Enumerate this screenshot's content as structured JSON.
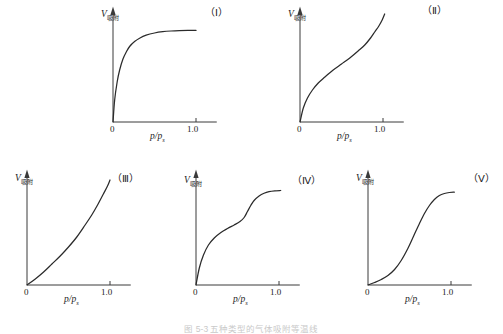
{
  "figure": {
    "caption": "图 5-3  五种类型的气体吸附等温线",
    "axis": {
      "y_label_main": "V",
      "y_label_sub": "吸附",
      "x_label_main": "p/p",
      "x_label_sub": "s",
      "x_tick_zero": "0",
      "x_tick_one": "1.0"
    },
    "stroke_color": "#2b2b2b",
    "axis_color": "#3a3a3a",
    "background": "#ffffff"
  },
  "chart_data": [
    {
      "type": "line",
      "title": "（Ⅰ）",
      "tag": "（Ⅰ）",
      "xlabel": "p/ps",
      "ylabel": "V吸附",
      "xlim": [
        0,
        1.25
      ],
      "ylim": [
        0,
        1.0
      ],
      "grid": false,
      "legend": "none",
      "description": "Type I isotherm — Langmuir, steep uptake at low relative pressure then horizontal plateau (microporous).",
      "x": [
        0.0,
        0.02,
        0.05,
        0.08,
        0.12,
        0.16,
        0.2,
        0.26,
        0.32,
        0.4,
        0.5,
        0.6,
        0.7,
        0.8,
        0.9,
        1.0
      ],
      "y": [
        0.0,
        0.22,
        0.4,
        0.52,
        0.63,
        0.7,
        0.755,
        0.805,
        0.838,
        0.868,
        0.89,
        0.903,
        0.91,
        0.914,
        0.916,
        0.916
      ]
    },
    {
      "type": "line",
      "title": "（Ⅱ）",
      "tag": "（Ⅱ）",
      "xlabel": "p/ps",
      "ylabel": "V吸附",
      "xlim": [
        0,
        1.25
      ],
      "ylim": [
        0,
        1.0
      ],
      "grid": false,
      "legend": "none",
      "description": "Type III isotherm shape as drawn — concave to pressure axis, gentle start, near-linear middle, sharp upturn approaching saturation.",
      "x": [
        0.0,
        0.04,
        0.09,
        0.15,
        0.22,
        0.3,
        0.4,
        0.5,
        0.6,
        0.7,
        0.78,
        0.85,
        0.9,
        0.95,
        0.99,
        1.02
      ],
      "y": [
        0.0,
        0.14,
        0.24,
        0.32,
        0.39,
        0.45,
        0.52,
        0.58,
        0.64,
        0.71,
        0.77,
        0.84,
        0.9,
        0.96,
        1.02,
        1.08
      ]
    },
    {
      "type": "line",
      "title": "（Ⅲ）",
      "tag": "（Ⅲ）",
      "xlabel": "p/ps",
      "ylabel": "V吸附",
      "xlim": [
        0,
        1.25
      ],
      "ylim": [
        0,
        1.0
      ],
      "grid": false,
      "legend": "none",
      "description": "Type III isotherm — convex to the pressure axis throughout, slow start and accelerating uptake near saturation.",
      "x": [
        0.0,
        0.1,
        0.2,
        0.3,
        0.4,
        0.5,
        0.6,
        0.7,
        0.78,
        0.85,
        0.92,
        0.97,
        1.0
      ],
      "y": [
        0.0,
        0.06,
        0.13,
        0.21,
        0.29,
        0.38,
        0.48,
        0.6,
        0.7,
        0.8,
        0.91,
        0.99,
        1.05
      ]
    },
    {
      "type": "line",
      "title": "（Ⅳ）",
      "tag": "（Ⅳ）",
      "xlabel": "p/ps",
      "ylabel": "V吸附",
      "xlim": [
        0,
        1.25
      ],
      "ylim": [
        0,
        1.0
      ],
      "grid": false,
      "legend": "none",
      "description": "Type IV isotherm — initial monolayer knee, intermediate shoulder, capillary-condensation step then final plateau (mesoporous).",
      "x": [
        0.0,
        0.04,
        0.09,
        0.15,
        0.22,
        0.3,
        0.38,
        0.46,
        0.53,
        0.58,
        0.62,
        0.66,
        0.7,
        0.76,
        0.82,
        0.88,
        0.95,
        1.02
      ],
      "y": [
        0.0,
        0.17,
        0.3,
        0.4,
        0.47,
        0.525,
        0.565,
        0.6,
        0.635,
        0.675,
        0.735,
        0.795,
        0.845,
        0.89,
        0.918,
        0.934,
        0.942,
        0.945
      ]
    },
    {
      "type": "line",
      "title": "（Ⅴ）",
      "tag": "（Ⅴ）",
      "xlabel": "p/ps",
      "ylabel": "V吸附",
      "xlim": [
        0,
        1.25
      ],
      "ylim": [
        0,
        1.0
      ],
      "grid": false,
      "legend": "none",
      "description": "Type V isotherm — sigmoid, very low uptake at low relative pressure, steep capillary condensation step, then plateau.",
      "x": [
        0.0,
        0.08,
        0.16,
        0.24,
        0.32,
        0.4,
        0.48,
        0.55,
        0.62,
        0.68,
        0.74,
        0.8,
        0.86,
        0.92,
        0.98,
        1.04
      ],
      "y": [
        0.0,
        0.025,
        0.055,
        0.095,
        0.155,
        0.245,
        0.365,
        0.49,
        0.615,
        0.715,
        0.795,
        0.855,
        0.895,
        0.915,
        0.925,
        0.928
      ]
    }
  ],
  "panels": [
    {
      "tag": "（Ⅰ）",
      "ylabel_main": "V",
      "ylabel_sub": "吸附",
      "xlabel_main": "p/p",
      "xlabel_sub": "s",
      "tick_zero": "0",
      "tick_one": "1.0"
    },
    {
      "tag": "（Ⅱ）",
      "ylabel_main": "V",
      "ylabel_sub": "吸附",
      "xlabel_main": "p/p",
      "xlabel_sub": "s",
      "tick_zero": "0",
      "tick_one": "1.0"
    },
    {
      "tag": "（Ⅲ）",
      "ylabel_main": "V",
      "ylabel_sub": "吸附",
      "xlabel_main": "p/p",
      "xlabel_sub": "s",
      "tick_zero": "0",
      "tick_one": "1.0"
    },
    {
      "tag": "（Ⅳ）",
      "ylabel_main": "V",
      "ylabel_sub": "吸附",
      "xlabel_main": "p/p",
      "xlabel_sub": "s",
      "tick_zero": "0",
      "tick_one": "1.0"
    },
    {
      "tag": "（Ⅴ）",
      "ylabel_main": "V",
      "ylabel_sub": "吸附",
      "xlabel_main": "p/p",
      "xlabel_sub": "s",
      "tick_zero": "0",
      "tick_one": "1.0"
    }
  ]
}
